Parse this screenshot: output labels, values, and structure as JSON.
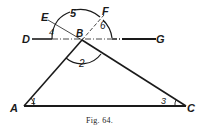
{
  "figure": {
    "caption": "Fig. 64.",
    "points": {
      "A": "A",
      "B": "B",
      "C": "C",
      "D": "D",
      "E": "E",
      "F": "F",
      "G": "G"
    },
    "angles": {
      "a1": "1",
      "a2": "2",
      "a3": "3",
      "a4": "4",
      "a5": "5",
      "a6": "6"
    },
    "colors": {
      "ink": "#1a1a1a",
      "background": "#ffffff"
    }
  }
}
